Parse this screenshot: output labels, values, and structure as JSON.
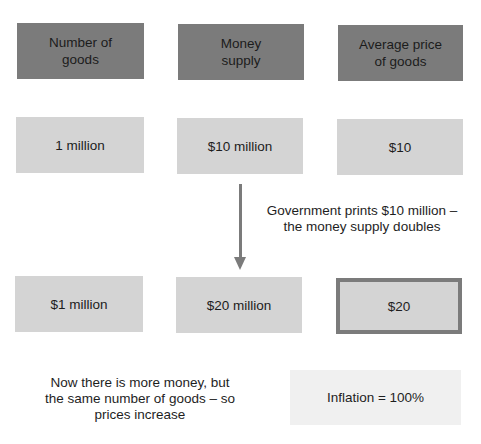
{
  "header_row": {
    "items": [
      {
        "label": "Number of\ngoods"
      },
      {
        "label": "Money\nsupply"
      },
      {
        "label": "Average price\nof goods"
      }
    ]
  },
  "before_row": {
    "items": [
      {
        "value": "1 million"
      },
      {
        "value": "$10 million"
      },
      {
        "value": "$10"
      }
    ]
  },
  "arrow": {
    "icon": "arrow-down-icon",
    "annotation": "Government prints $10 million –\nthe money supply doubles"
  },
  "after_row": {
    "items": [
      {
        "value": "$1 million"
      },
      {
        "value": "$20 million"
      },
      {
        "value": "$20"
      }
    ]
  },
  "conclusion": {
    "text": "Now there is more money, but\nthe same number of goods – so\nprices increase",
    "result": "Inflation = 100%"
  },
  "colors": {
    "header_fill": "#7b7b7b",
    "value_fill": "#d4d4d4",
    "highlight_border": "#7b7b7b",
    "result_fill": "#f0f0f0",
    "arrow": "#7b7b7b"
  }
}
